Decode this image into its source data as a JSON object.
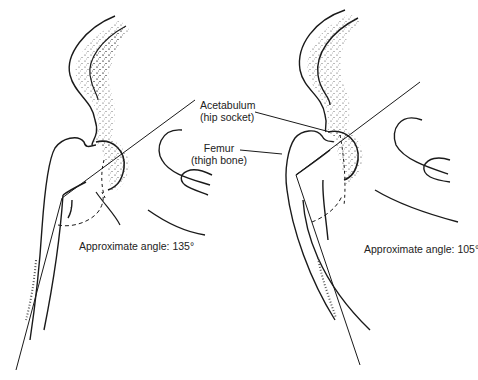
{
  "figure": {
    "labels": {
      "acetabulum": {
        "name": "Acetabulum",
        "desc": "(hip socket)"
      },
      "femur": {
        "name": "Femur",
        "desc": "(thigh bone)"
      }
    },
    "left_hip": {
      "angle_text": "Approximate angle: 135°",
      "angle_deg": 135
    },
    "right_hip": {
      "angle_text": "Approximate angle: 105°",
      "angle_deg": 105
    },
    "colors": {
      "ink": "#1a1a1a",
      "paper": "#ffffff"
    }
  }
}
